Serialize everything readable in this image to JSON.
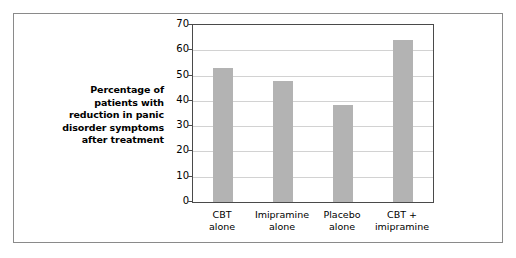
{
  "figure": {
    "background_color": "#ffffff",
    "border_color": "#8a8a8a",
    "axis_color": "#4a4a4a",
    "gridline_color": "#d2d2d2",
    "bar_color": "#b3b3b3"
  },
  "axis_caption": {
    "lines": [
      "Percentage of",
      "patients with",
      "reduction in panic",
      "disorder symptoms",
      "after treatment"
    ]
  },
  "chart_data": {
    "type": "bar",
    "title": "",
    "xlabel": "",
    "ylabel": "Percentage of patients with reduction in panic disorder symptoms after treatment",
    "categories": [
      "CBT alone",
      "Imipramine alone",
      "Placebo alone",
      "CBT + imipramine"
    ],
    "category_lines": [
      [
        "CBT",
        "alone"
      ],
      [
        "Imipramine",
        "alone"
      ],
      [
        "Placebo",
        "alone"
      ],
      [
        "CBT +",
        "imipramine"
      ]
    ],
    "values": [
      53,
      48,
      38.5,
      64
    ],
    "ylim": [
      0,
      70
    ],
    "yticks": [
      0,
      10,
      20,
      30,
      40,
      50,
      60,
      70
    ],
    "ytick_labels": [
      "0",
      "10",
      "20",
      "30",
      "40",
      "50",
      "60",
      "70"
    ],
    "grid": true,
    "legend": false,
    "legend_position": "none",
    "bar_color": "#b3b3b3"
  }
}
